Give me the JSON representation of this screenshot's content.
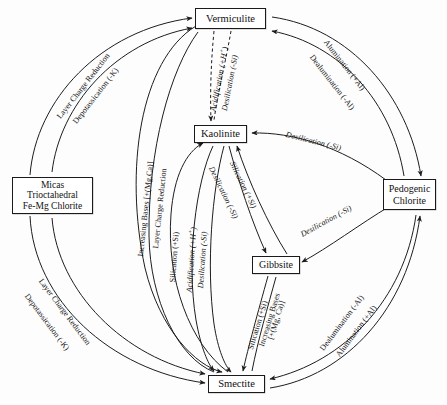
{
  "diagram": {
    "type": "cycle-diagram",
    "nodes": [
      {
        "id": "micas",
        "lines": [
          "Micas",
          "Trioctahedral",
          "Fe-Mg Chlorite"
        ]
      },
      {
        "id": "vermiculite",
        "lines": [
          "Vermiculite"
        ]
      },
      {
        "id": "kaolinite",
        "lines": [
          "Kaolinite"
        ]
      },
      {
        "id": "pedogenic_chlorite",
        "lines": [
          "Pedogenic",
          "Chlorite"
        ]
      },
      {
        "id": "gibbsite",
        "lines": [
          "Gibbsite"
        ]
      },
      {
        "id": "smectite",
        "lines": [
          "Smectite"
        ]
      }
    ],
    "edge_labels": {
      "micas_to_vermiculite_1": "Layer Charge Reduction",
      "micas_to_vermiculite_2": "Depotassication (-K)",
      "vermiculite_to_pedogenic_1": "Alumination (+Al)",
      "vermiculite_to_pedogenic_2": "Dealumination (-Al)",
      "micas_to_smectite_1": "Layer Charge Reduction",
      "micas_to_smectite_2": "Depotassication (-K)",
      "smectite_to_pedogenic_1": "Dealumination (-Al)",
      "smectite_to_pedogenic_2": "Alumination (+Al)",
      "vermiculite_to_kaolinite_1": "Acidification (+H",
      "vermiculite_to_kaolinite_1_sup": "+",
      "vermiculite_to_kaolinite_1_tail": ")",
      "vermiculite_to_kaolinite_2": "Desilication (-Si)",
      "vermiculite_smectite_1": "Increasing Bases [+(Mg,Ca)]",
      "vermiculite_smectite_2": "Layer Charge Reduction",
      "kaolinite_smectite_1": "Silication (+Si)",
      "kaolinite_smectite_2": "Acidification (+H",
      "kaolinite_smectite_2_sup": "+",
      "kaolinite_smectite_2_tail": ")",
      "kaolinite_smectite_3": "Desilication (-Si)",
      "kaolinite_gibbsite_1": "Desilication (-Si)",
      "kaolinite_gibbsite_2": "Silication (+Si)",
      "gibbsite_smectite_1": "Silication (+Si)",
      "gibbsite_smectite_2": "Increasing Bases",
      "gibbsite_smectite_3": "[+(Mg, Ca)]",
      "pedogenic_to_kaolinite": "Desilication (-Si)",
      "pedogenic_to_gibbsite": "Desilication (-Si)"
    },
    "colors": {
      "stroke": "#1d1d1d",
      "text": "#141414",
      "background": "#fdfdfd",
      "node_fill": "#ffffff"
    }
  }
}
